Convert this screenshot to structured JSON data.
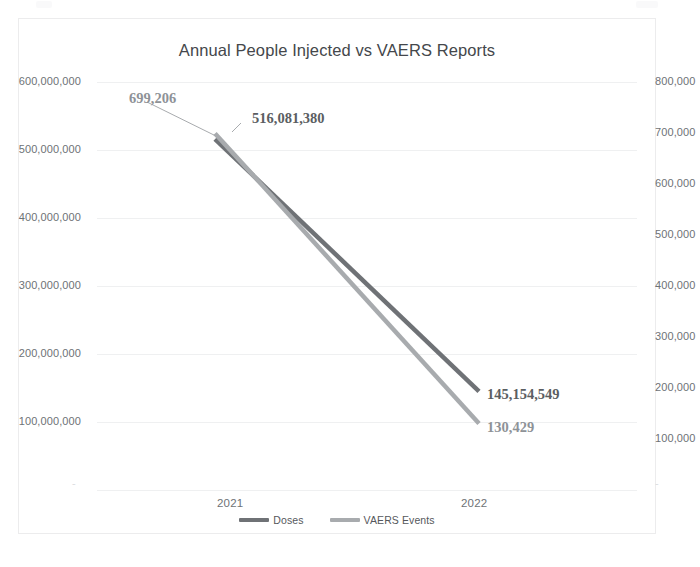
{
  "chart_data": {
    "type": "line",
    "title": "Annual People Injected vs VAERS Reports",
    "xlabel": "",
    "ylabel": "",
    "categories": [
      "2021",
      "2022"
    ],
    "grid": true,
    "legend_position": "bottom",
    "series": [
      {
        "name": "Doses",
        "axis": "left",
        "color": "#6f7276",
        "values": [
          516081380,
          145154549
        ],
        "point_labels": [
          "516,081,380",
          "145,154,549"
        ]
      },
      {
        "name": "VAERS Events",
        "axis": "right",
        "color": "#a8abae",
        "values": [
          699206,
          130429
        ],
        "point_labels": [
          "699,206",
          "130,429"
        ]
      }
    ],
    "left_axis": {
      "title": "",
      "ylim": [
        0,
        600000000
      ],
      "ticks": [
        "600,000,000",
        "500,000,000",
        "400,000,000",
        "300,000,000",
        "200,000,000",
        "100,000,000"
      ],
      "zero_tick": "-"
    },
    "right_axis": {
      "title": "",
      "ylim": [
        0,
        800000
      ],
      "ticks": [
        "800,000",
        "700,000",
        "600,000",
        "500,000",
        "400,000",
        "300,000",
        "200,000",
        "100,000"
      ],
      "zero_tick": "-"
    },
    "x_tick_labels": [
      "2021",
      "2022"
    ],
    "annotations": [
      {
        "text": "699,206",
        "series": "VAERS Events",
        "category": "2021"
      },
      {
        "text": "516,081,380",
        "series": "Doses",
        "category": "2021"
      },
      {
        "text": "145,154,549",
        "series": "Doses",
        "category": "2022"
      },
      {
        "text": "130,429",
        "series": "VAERS Events",
        "category": "2022"
      }
    ],
    "colors": {
      "doses_line": "#6f7276",
      "vaers_line": "#a8abae",
      "gridline": "#eff0f1",
      "axis_text": "#6e7276",
      "title_text": "#44474b",
      "card_border": "#ececed",
      "label_dark": "#5b5e62",
      "label_light": "#8e9297",
      "background": "#ffffff"
    }
  },
  "chart": {
    "title": "Annual People Injected vs VAERS Reports",
    "left_ticks": {
      "t600": "600,000,000",
      "t500": "500,000,000",
      "t400": "400,000,000",
      "t300": "300,000,000",
      "t200": "200,000,000",
      "t100": "100,000,000",
      "t0": "-"
    },
    "right_ticks": {
      "t800": "800,000",
      "t700": "700,000",
      "t600": "600,000",
      "t500": "500,000",
      "t400": "400,000",
      "t300": "300,000",
      "t200": "200,000",
      "t100": "100,000",
      "t0": "-"
    },
    "categories": {
      "c2021": "2021",
      "c2022": "2022"
    },
    "labels": {
      "vaers_start": "699,206",
      "doses_start": "516,081,380",
      "doses_end": "145,154,549",
      "vaers_end": "130,429"
    },
    "legend": {
      "doses": "Doses",
      "vaers": "VAERS Events"
    }
  }
}
